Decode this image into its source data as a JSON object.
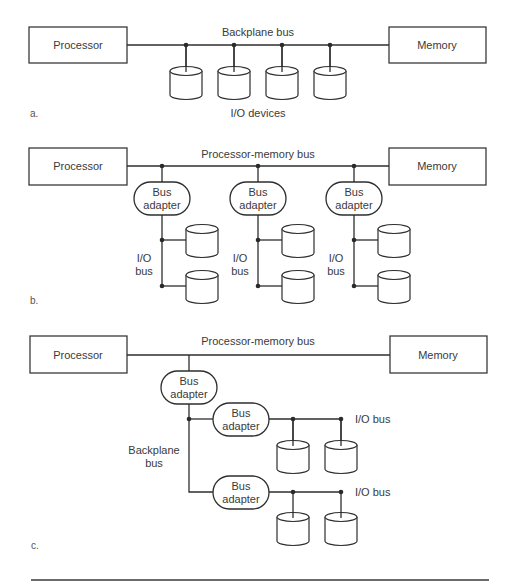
{
  "figure": {
    "panel_a": {
      "label": "a.",
      "processor": "Processor",
      "memory": "Memory",
      "bus_label": "Backplane bus",
      "devices_label": "I/O devices",
      "device_count": 4
    },
    "panel_b": {
      "label": "b.",
      "processor": "Processor",
      "memory": "Memory",
      "bus_label": "Processor-memory bus",
      "adapters": [
        {
          "line1": "Bus",
          "line2": "adapter",
          "io_bus_line1": "I/O",
          "io_bus_line2": "bus"
        },
        {
          "line1": "Bus",
          "line2": "adapter",
          "io_bus_line1": "I/O",
          "io_bus_line2": "bus"
        },
        {
          "line1": "Bus",
          "line2": "adapter",
          "io_bus_line1": "I/O",
          "io_bus_line2": "bus"
        }
      ]
    },
    "panel_c": {
      "label": "c.",
      "processor": "Processor",
      "memory": "Memory",
      "bus_label": "Processor-memory bus",
      "main_adapter": {
        "line1": "Bus",
        "line2": "adapter"
      },
      "backplane_label_line1": "Backplane",
      "backplane_label_line2": "bus",
      "sub_adapters": [
        {
          "line1": "Bus",
          "line2": "adapter",
          "io_bus": "I/O bus"
        },
        {
          "line1": "Bus",
          "line2": "adapter",
          "io_bus": "I/O bus"
        }
      ]
    }
  }
}
